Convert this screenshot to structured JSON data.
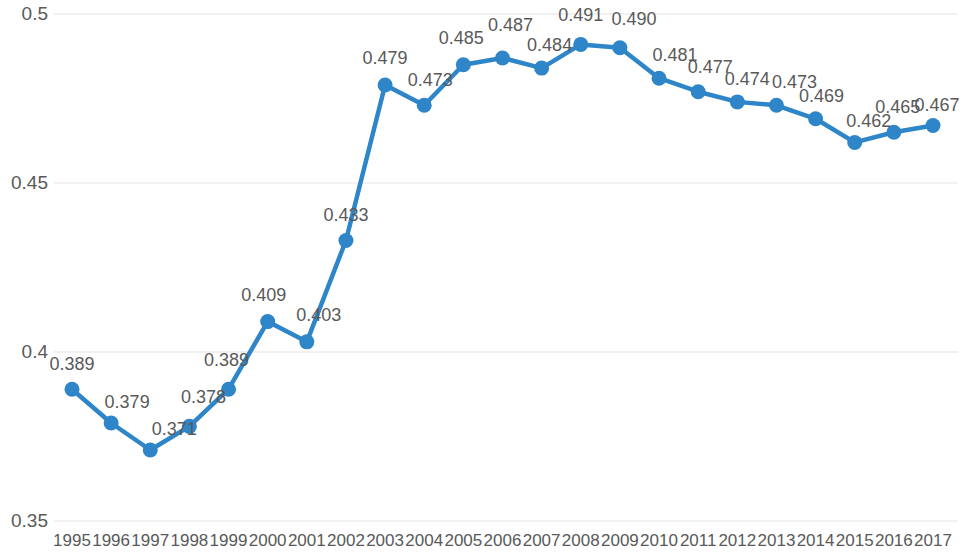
{
  "chart_data": {
    "type": "line",
    "title": "",
    "subtitle": "",
    "xlabel": "",
    "ylabel": "",
    "grid": true,
    "legend": false,
    "legend_position": "none",
    "series_color": "#2E86C8",
    "label_color": "#595959",
    "gridline_color": "#E3E3E3",
    "ylim": [
      0.35,
      0.5
    ],
    "yticks": [
      "0.35",
      "0.4",
      "0.45",
      "0.5"
    ],
    "ytick_values": [
      0.35,
      0.4,
      0.45,
      0.5
    ],
    "categories": [
      "1995",
      "1996",
      "1997",
      "1998",
      "1999",
      "2000",
      "2001",
      "2002",
      "2003",
      "2004",
      "2005",
      "2006",
      "2007",
      "2008",
      "2009",
      "2010",
      "2011",
      "2012",
      "2013",
      "2014",
      "2015",
      "2016",
      "2017"
    ],
    "values": [
      0.389,
      0.379,
      0.371,
      0.378,
      0.389,
      0.409,
      0.403,
      0.433,
      0.479,
      0.473,
      0.485,
      0.487,
      0.484,
      0.491,
      0.49,
      0.481,
      0.477,
      0.474,
      0.473,
      0.469,
      0.462,
      0.465,
      0.467
    ],
    "data_labels": [
      "0.389",
      "0.379",
      "0.371",
      "0.378",
      "0.389",
      "0.409",
      "0.403",
      "0.433",
      "0.479",
      "0.473",
      "0.485",
      "0.487",
      "0.484",
      "0.491",
      "0.490",
      "0.481",
      "0.477",
      "0.474",
      "0.473",
      "0.469",
      "0.462",
      "0.465",
      "0.467"
    ],
    "label_offsets": [
      {
        "dx": 0,
        "dy": -26
      },
      {
        "dx": 16,
        "dy": -22
      },
      {
        "dx": 24,
        "dy": -22
      },
      {
        "dx": 14,
        "dy": -30
      },
      {
        "dx": -2,
        "dy": -30
      },
      {
        "dx": -4,
        "dy": -28
      },
      {
        "dx": 12,
        "dy": -28
      },
      {
        "dx": 0,
        "dy": -26
      },
      {
        "dx": 0,
        "dy": -28
      },
      {
        "dx": 6,
        "dy": -26
      },
      {
        "dx": -2,
        "dy": -28
      },
      {
        "dx": 8,
        "dy": -34
      },
      {
        "dx": 8,
        "dy": -24
      },
      {
        "dx": 0,
        "dy": -30
      },
      {
        "dx": 14,
        "dy": -30
      },
      {
        "dx": 16,
        "dy": -24
      },
      {
        "dx": 12,
        "dy": -26
      },
      {
        "dx": 10,
        "dy": -24
      },
      {
        "dx": 18,
        "dy": -24
      },
      {
        "dx": 6,
        "dy": -24
      },
      {
        "dx": 14,
        "dy": -22
      },
      {
        "dx": 4,
        "dy": -26
      },
      {
        "dx": 4,
        "dy": -22
      }
    ]
  }
}
